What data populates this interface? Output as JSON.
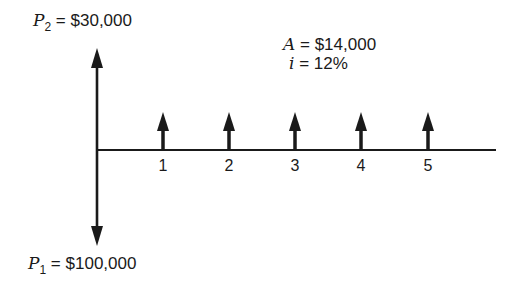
{
  "diagram": {
    "type": "cash-flow-diagram",
    "receipt_label": {
      "symbol": "P",
      "subscript": "2",
      "value": " = $30,000"
    },
    "payment_label": {
      "symbol": "P",
      "subscript": "1",
      "value": " = $100,000"
    },
    "annuity": {
      "symbol": "A",
      "value": " = $14,000"
    },
    "interest": {
      "symbol": "i",
      "value": " = 12%"
    },
    "periods": [
      "1",
      "2",
      "3",
      "4",
      "5"
    ],
    "colors": {
      "ink": "#1a1a1a",
      "background": "#ffffff"
    }
  }
}
